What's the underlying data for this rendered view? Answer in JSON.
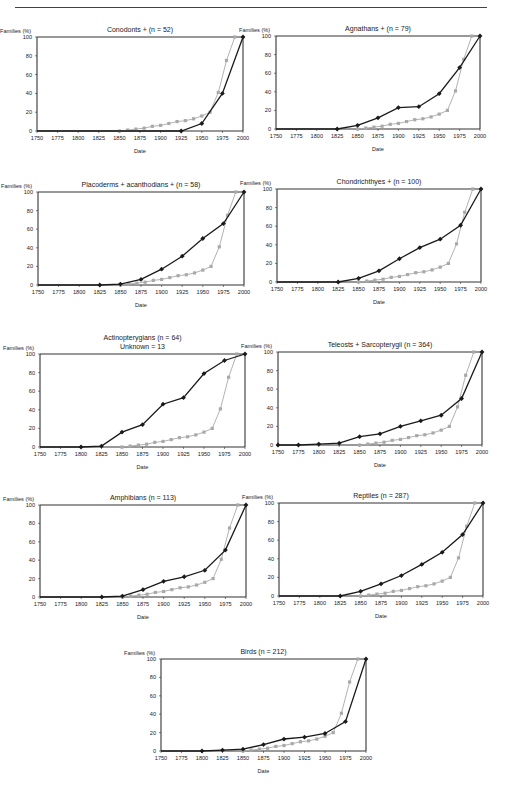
{
  "header": {
    "rule": true
  },
  "common": {
    "ylabel": "Families (%)",
    "xlabel": "Date",
    "xticks": [
      1750,
      1775,
      1800,
      1825,
      1850,
      1875,
      1900,
      1925,
      1950,
      1975,
      2000
    ],
    "yticks": [
      0,
      20,
      40,
      60,
      80,
      100
    ],
    "dark_color": "#1a1a1a",
    "gray_color": "#a9a9a9"
  },
  "chart_data": [
    {
      "id": "conodonts",
      "type": "line",
      "title": "Conodonts + (n = 52)",
      "title2": "",
      "xlabel": "Date",
      "ylabel": "Families (%)",
      "xlim": [
        1750,
        2000
      ],
      "ylim": [
        0,
        100
      ],
      "layout": {
        "left": 37,
        "top": 37,
        "right": 243,
        "bottom": 131
      },
      "series": [
        {
          "name": "group",
          "color": "#1a1a1a",
          "marker": "diamond",
          "x": [
            1925,
            1950,
            1975,
            2000
          ],
          "y": [
            0,
            8,
            40,
            100
          ]
        },
        {
          "name": "all-families",
          "color": "#a9a9a9",
          "marker": "square",
          "x": [
            1850,
            1860,
            1870,
            1880,
            1890,
            1900,
            1910,
            1920,
            1930,
            1940,
            1950,
            1960,
            1970,
            1980,
            1990
          ],
          "y": [
            0,
            1,
            2,
            3,
            5,
            6,
            8,
            10,
            11,
            13,
            16,
            20,
            41,
            75,
            100
          ]
        }
      ]
    },
    {
      "id": "agnathans",
      "type": "line",
      "title": "Agnathans + (n = 79)",
      "title2": "",
      "xlabel": "Date",
      "ylabel": "Families (%)",
      "xlim": [
        1750,
        2000
      ],
      "ylim": [
        0,
        100
      ],
      "layout": {
        "left": 276,
        "top": 36,
        "right": 480,
        "bottom": 129
      },
      "series": [
        {
          "name": "group",
          "color": "#1a1a1a",
          "marker": "diamond",
          "x": [
            1825,
            1850,
            1875,
            1900,
            1925,
            1950,
            1975,
            2000
          ],
          "y": [
            0,
            4,
            12,
            23,
            24,
            38,
            66,
            100
          ]
        },
        {
          "name": "all-families",
          "color": "#a9a9a9",
          "marker": "square",
          "x": [
            1850,
            1860,
            1870,
            1880,
            1890,
            1900,
            1910,
            1920,
            1930,
            1940,
            1950,
            1960,
            1970,
            1980,
            1990
          ],
          "y": [
            0,
            1,
            2,
            3,
            5,
            6,
            8,
            10,
            11,
            13,
            16,
            20,
            41,
            75,
            100
          ]
        }
      ]
    },
    {
      "id": "placoderms",
      "type": "line",
      "title": "Placoderms + acanthodians + (n = 58)",
      "title2": "",
      "xlabel": "Date",
      "ylabel": "Families (%)",
      "xlim": [
        1750,
        2000
      ],
      "ylim": [
        0,
        100
      ],
      "layout": {
        "left": 38,
        "top": 192,
        "right": 244,
        "bottom": 285
      },
      "series": [
        {
          "name": "group",
          "color": "#1a1a1a",
          "marker": "diamond",
          "x": [
            1825,
            1850,
            1875,
            1900,
            1925,
            1950,
            1975,
            2000
          ],
          "y": [
            0,
            1,
            6,
            17,
            31,
            50,
            66,
            100
          ]
        },
        {
          "name": "all-families",
          "color": "#a9a9a9",
          "marker": "square",
          "x": [
            1850,
            1860,
            1870,
            1880,
            1890,
            1900,
            1910,
            1920,
            1930,
            1940,
            1950,
            1960,
            1970,
            1980,
            1990
          ],
          "y": [
            0,
            1,
            2,
            3,
            5,
            6,
            8,
            10,
            11,
            13,
            16,
            20,
            41,
            75,
            100
          ]
        }
      ]
    },
    {
      "id": "chondrichthyes",
      "type": "line",
      "title": "Chondrichthyes + (n = 100)",
      "title2": "",
      "xlabel": "Date",
      "ylabel": "Families (%)",
      "xlim": [
        1750,
        2000
      ],
      "ylim": [
        0,
        100
      ],
      "layout": {
        "left": 277,
        "top": 189,
        "right": 481,
        "bottom": 282
      },
      "series": [
        {
          "name": "group",
          "color": "#1a1a1a",
          "marker": "diamond",
          "x": [
            1825,
            1850,
            1875,
            1900,
            1925,
            1950,
            1975,
            2000
          ],
          "y": [
            0,
            4,
            12,
            25,
            37,
            46,
            61,
            100
          ]
        },
        {
          "name": "all-families",
          "color": "#a9a9a9",
          "marker": "square",
          "x": [
            1850,
            1860,
            1870,
            1880,
            1890,
            1900,
            1910,
            1920,
            1930,
            1940,
            1950,
            1960,
            1970,
            1980,
            1990
          ],
          "y": [
            0,
            1,
            2,
            3,
            5,
            6,
            8,
            10,
            11,
            13,
            16,
            20,
            41,
            75,
            100
          ]
        }
      ]
    },
    {
      "id": "actinopterygians",
      "type": "line",
      "title": "Actinopterygians (n = 64)",
      "title2": "Unknown = 13",
      "xlabel": "Date",
      "ylabel": "Families (%)",
      "xlim": [
        1750,
        2000
      ],
      "ylim": [
        0,
        100
      ],
      "layout": {
        "left": 40,
        "top": 354,
        "right": 245,
        "bottom": 447
      },
      "series": [
        {
          "name": "group",
          "color": "#1a1a1a",
          "marker": "diamond",
          "x": [
            1800,
            1825,
            1850,
            1875,
            1900,
            1925,
            1950,
            1975,
            2000
          ],
          "y": [
            0,
            1,
            16,
            24,
            46,
            53,
            79,
            93,
            100
          ]
        },
        {
          "name": "all-families",
          "color": "#a9a9a9",
          "marker": "square",
          "x": [
            1850,
            1860,
            1870,
            1880,
            1890,
            1900,
            1910,
            1920,
            1930,
            1940,
            1950,
            1960,
            1970,
            1980,
            1990
          ],
          "y": [
            0,
            1,
            2,
            3,
            5,
            6,
            8,
            10,
            11,
            13,
            16,
            20,
            41,
            75,
            100
          ]
        }
      ]
    },
    {
      "id": "teleosts",
      "type": "line",
      "title": "Teleosts + Sarcopterygii (n = 364)",
      "title2": "",
      "xlabel": "Date",
      "ylabel": "Families (%)",
      "xlim": [
        1750,
        2000
      ],
      "ylim": [
        0,
        100
      ],
      "layout": {
        "left": 278,
        "top": 352,
        "right": 482,
        "bottom": 445
      },
      "series": [
        {
          "name": "group",
          "color": "#1a1a1a",
          "marker": "diamond",
          "x": [
            1750,
            1775,
            1800,
            1825,
            1850,
            1875,
            1900,
            1925,
            1950,
            1975,
            2000
          ],
          "y": [
            0,
            0,
            1,
            2,
            9,
            12,
            20,
            26,
            32,
            50,
            100
          ]
        },
        {
          "name": "all-families",
          "color": "#a9a9a9",
          "marker": "square",
          "x": [
            1850,
            1860,
            1870,
            1880,
            1890,
            1900,
            1910,
            1920,
            1930,
            1940,
            1950,
            1960,
            1970,
            1980,
            1990
          ],
          "y": [
            0,
            1,
            2,
            3,
            5,
            6,
            8,
            10,
            11,
            13,
            16,
            20,
            41,
            75,
            100
          ]
        }
      ]
    },
    {
      "id": "amphibians",
      "type": "line",
      "title": "Amphibians (n = 113)",
      "title2": "",
      "xlabel": "Date",
      "ylabel": "Families (%)",
      "xlim": [
        1750,
        2000
      ],
      "ylim": [
        0,
        100
      ],
      "layout": {
        "left": 40,
        "top": 505,
        "right": 246,
        "bottom": 597
      },
      "series": [
        {
          "name": "group",
          "color": "#1a1a1a",
          "marker": "diamond",
          "x": [
            1825,
            1850,
            1875,
            1900,
            1925,
            1950,
            1975,
            2000
          ],
          "y": [
            0,
            1,
            8,
            17,
            22,
            29,
            51,
            100
          ]
        },
        {
          "name": "all-families",
          "color": "#a9a9a9",
          "marker": "square",
          "x": [
            1850,
            1860,
            1870,
            1880,
            1890,
            1900,
            1910,
            1920,
            1930,
            1940,
            1950,
            1960,
            1970,
            1980,
            1990
          ],
          "y": [
            0,
            1,
            2,
            3,
            5,
            6,
            8,
            10,
            11,
            13,
            16,
            20,
            41,
            75,
            100
          ]
        }
      ]
    },
    {
      "id": "reptiles",
      "type": "line",
      "title": "Reptiles (n = 287)",
      "title2": "",
      "xlabel": "Date",
      "ylabel": "Families (%)",
      "xlim": [
        1750,
        2000
      ],
      "ylim": [
        0,
        100
      ],
      "layout": {
        "left": 279,
        "top": 503,
        "right": 483,
        "bottom": 596
      },
      "series": [
        {
          "name": "group",
          "color": "#1a1a1a",
          "marker": "diamond",
          "x": [
            1825,
            1850,
            1875,
            1900,
            1925,
            1950,
            1975,
            2000
          ],
          "y": [
            0,
            5,
            13,
            22,
            34,
            47,
            66,
            100
          ]
        },
        {
          "name": "all-families",
          "color": "#a9a9a9",
          "marker": "square",
          "x": [
            1850,
            1860,
            1870,
            1880,
            1890,
            1900,
            1910,
            1920,
            1930,
            1940,
            1950,
            1960,
            1970,
            1980,
            1990
          ],
          "y": [
            0,
            1,
            2,
            3,
            5,
            6,
            8,
            10,
            11,
            13,
            16,
            20,
            41,
            75,
            100
          ]
        }
      ]
    },
    {
      "id": "birds",
      "type": "line",
      "title": "Birds (n = 212)",
      "title2": "",
      "xlabel": "Date",
      "ylabel": "Families (%)",
      "xlim": [
        1750,
        2000
      ],
      "ylim": [
        0,
        100
      ],
      "layout": {
        "left": 161,
        "top": 659,
        "right": 366,
        "bottom": 751
      },
      "series": [
        {
          "name": "group",
          "color": "#1a1a1a",
          "marker": "diamond",
          "x": [
            1800,
            1825,
            1850,
            1875,
            1900,
            1925,
            1950,
            1975,
            2000
          ],
          "y": [
            0,
            1,
            2,
            7,
            13,
            15,
            19,
            32,
            100
          ]
        },
        {
          "name": "all-families",
          "color": "#a9a9a9",
          "marker": "square",
          "x": [
            1850,
            1860,
            1870,
            1880,
            1890,
            1900,
            1910,
            1920,
            1930,
            1940,
            1950,
            1960,
            1970,
            1980,
            1990
          ],
          "y": [
            0,
            1,
            2,
            3,
            5,
            6,
            8,
            10,
            11,
            13,
            16,
            20,
            41,
            75,
            100
          ]
        }
      ]
    }
  ]
}
